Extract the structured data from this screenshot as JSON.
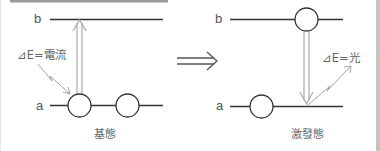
{
  "diagram": {
    "arrow_between": "⟹",
    "ground_state": {
      "caption": "基態",
      "level_b_label": "b",
      "level_a_label": "a",
      "energy_label": "⊿E=電流",
      "transition": "up"
    },
    "excited_state": {
      "caption": "激發態",
      "level_b_label": "b",
      "level_a_label": "a",
      "energy_label": "⊿E=光",
      "transition": "down"
    },
    "colors": {
      "line": "#333333",
      "arrow": "#aaaaaa",
      "text": "#555555",
      "frame": "#b0b0b0"
    }
  }
}
